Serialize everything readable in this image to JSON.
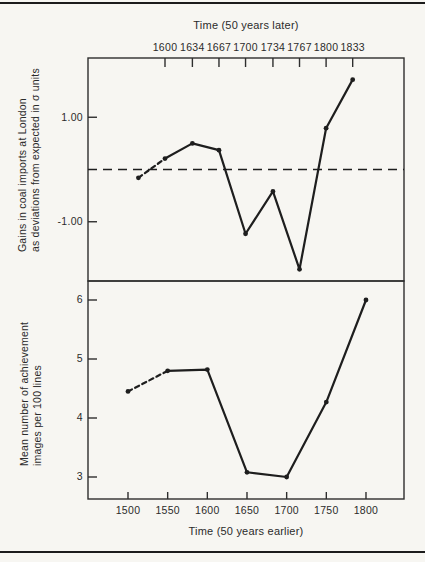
{
  "page": {
    "background_color": "#f7f6f2",
    "ink_color": "#1e1e1e"
  },
  "chart_data": [
    {
      "type": "line",
      "panel": "top",
      "xlabel": "Time (50 years later)",
      "xlabel_position": "top",
      "ylabel_lines": [
        "Gains in coal imports at London",
        "as deviations from expected in σ units"
      ],
      "x_tick_labels": [
        "1600",
        "1634",
        "1667",
        "1700",
        "1734",
        "1767",
        "1800",
        "1833"
      ],
      "x_tick_years": [
        1600,
        1634,
        1667,
        1700,
        1734,
        1767,
        1800,
        1833
      ],
      "y_tick_labels": [
        "1.00",
        "-1.00"
      ],
      "y_tick_values": [
        1.0,
        -1.0
      ],
      "reference_line": {
        "y": 0,
        "style": "dashed"
      },
      "x": [
        1567,
        1600,
        1634,
        1667,
        1700,
        1734,
        1767,
        1800,
        1833
      ],
      "y": [
        -0.16,
        0.21,
        0.5,
        0.37,
        -1.23,
        -0.42,
        -1.91,
        0.79,
        1.72
      ],
      "first_segment_dashed": true,
      "marker": "filled-circle",
      "ylim": [
        -2.1,
        2.1
      ],
      "grid": false,
      "legend": "none"
    },
    {
      "type": "line",
      "panel": "bottom",
      "xlabel": "Time (50 years earlier)",
      "xlabel_position": "bottom",
      "ylabel_lines": [
        "Mean number of achievement",
        "images per 100 lines"
      ],
      "x_tick_labels": [
        "1500",
        "1550",
        "1600",
        "1650",
        "1700",
        "1750",
        "1800"
      ],
      "x_tick_years": [
        1500,
        1550,
        1600,
        1650,
        1700,
        1750,
        1800
      ],
      "y_tick_labels": [
        "6",
        "5",
        "4",
        "3"
      ],
      "y_tick_values": [
        6,
        5,
        4,
        3
      ],
      "x": [
        1500,
        1550,
        1600,
        1650,
        1700,
        1750,
        1800
      ],
      "y": [
        4.45,
        4.8,
        4.82,
        3.08,
        3.0,
        4.27,
        6.0
      ],
      "first_segment_dashed": true,
      "marker": "filled-circle",
      "ylim": [
        2.6,
        6.3
      ],
      "grid": false,
      "legend": "none"
    }
  ]
}
